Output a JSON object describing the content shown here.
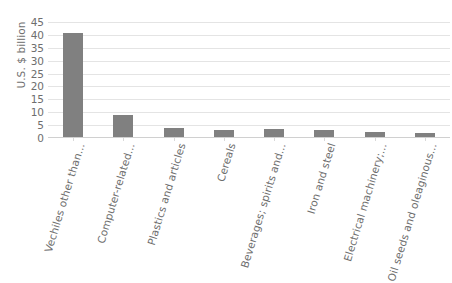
{
  "chart_data": {
    "type": "bar",
    "title": "",
    "subtitle": "",
    "xlabel": "",
    "ylabel": "U.S. $ billion",
    "ylim": [
      0,
      45
    ],
    "ytick_values": [
      0,
      5,
      10,
      15,
      20,
      25,
      30,
      35,
      40,
      45
    ],
    "ytick_labels": [
      "0",
      "5",
      "10",
      "15",
      "20",
      "25",
      "30",
      "35",
      "40",
      "45"
    ],
    "grid": true,
    "legend": false,
    "legend_position": "none",
    "bar_color": "#808080",
    "gridline_color": "#e4e4e4",
    "text_color": "#6e6e6e",
    "categories": [
      "Vechiles other than...",
      "Computer-related...",
      "Plastics and articles",
      "Cereals",
      "Beverages; spirits and...",
      "Iron and steel",
      "Electrical machinery;...",
      "Oil seeds and oleaginous..."
    ],
    "values": [
      40.5,
      8.5,
      3.6,
      2.6,
      3.0,
      2.6,
      2.0,
      1.4
    ]
  }
}
